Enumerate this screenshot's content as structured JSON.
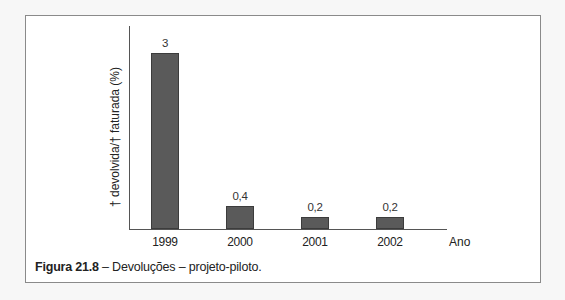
{
  "chart_data": {
    "type": "bar",
    "title": "",
    "categories": [
      "1999",
      "2000",
      "2001",
      "2002"
    ],
    "values": [
      3,
      0.4,
      0.2,
      0.2
    ],
    "value_labels": [
      "3",
      "0,4",
      "0,2",
      "0,2"
    ],
    "xlabel": "Ano",
    "ylabel": "† devolvida/† faturada (%)",
    "ylim": [
      0,
      3.4
    ],
    "grid": false,
    "legend": null,
    "bar_color": "#5a5a5a"
  },
  "figure": {
    "caption_number": "Figura 21.8",
    "caption_text": " – Devoluções – projeto-piloto."
  }
}
